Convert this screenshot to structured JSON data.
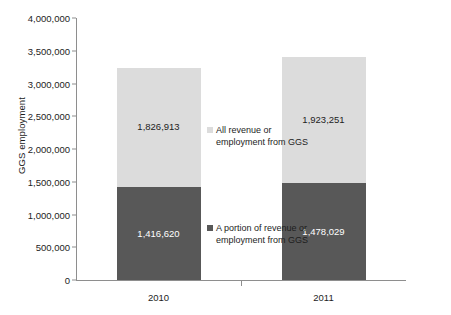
{
  "chart_data": {
    "type": "bar",
    "subtype": "stacked-bar",
    "title": "",
    "xlabel": "",
    "ylabel": "GGS employment",
    "categories": [
      "2010",
      "2011"
    ],
    "ylim": [
      0,
      4000000
    ],
    "ytick_values": [
      0,
      500000,
      1000000,
      1500000,
      2000000,
      2500000,
      3000000,
      3500000,
      4000000
    ],
    "ytick_labels": [
      "0",
      "500,000",
      "1,000,000",
      "1,500,000",
      "2,000,000",
      "2,500,000",
      "3,000,000",
      "3,500,000",
      "4,000,000"
    ],
    "grid": false,
    "legend_position": "inside-center",
    "series": [
      {
        "name": "A portion of revenue or employment from GGS",
        "name_line1": "A portion of revenue or",
        "name_line2": "employment from GGS",
        "color": "#585858",
        "values": [
          1416620,
          1478029
        ],
        "labels": [
          "1,416,620",
          "1,478,029"
        ]
      },
      {
        "name": "All revenue or employment from GGS",
        "name_line1": "All revenue or",
        "name_line2": "employment from GGS",
        "color": "#dcdcdc",
        "values": [
          1826913,
          1923251
        ],
        "labels": [
          "1,826,913",
          "1,923,251"
        ]
      }
    ],
    "totals": [
      3243533,
      3401280
    ]
  },
  "colors": {
    "light_segment": "#dcdcdc",
    "dark_segment": "#585858",
    "axis": "#8e8e8e",
    "text": "#1d1d1d",
    "background": "#ffffff"
  },
  "axis": {
    "y_title": "GGS employment"
  },
  "legend": {
    "top": {
      "line1": "All revenue or",
      "line2": "employment from GGS"
    },
    "bottom": {
      "line1": "A portion of revenue or",
      "line2": "employment from GGS"
    }
  },
  "title_remnant": ""
}
